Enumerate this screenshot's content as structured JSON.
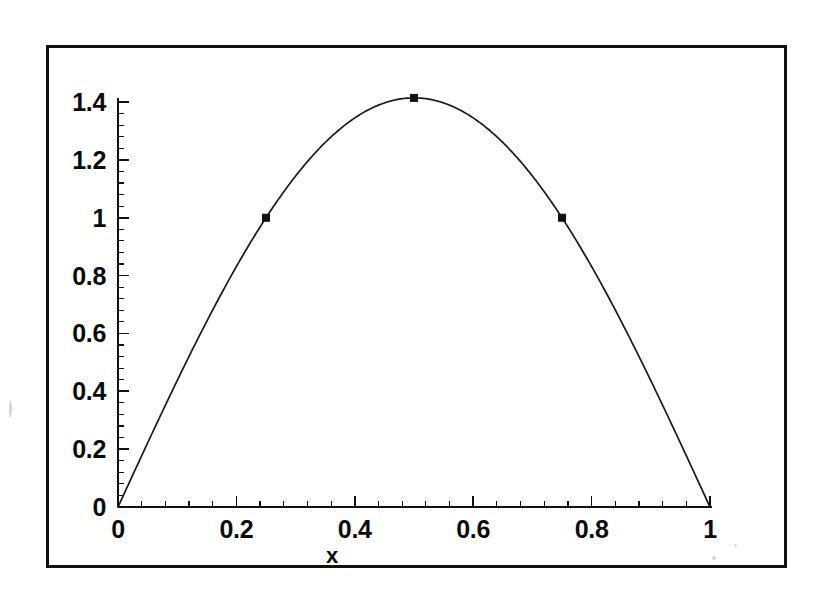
{
  "figure": {
    "background_color": "#ffffff",
    "frame_color": "#111111",
    "curve_color": "#1a1a1a",
    "marker_color": "#111111"
  },
  "chart_data": {
    "type": "line",
    "title": "",
    "subtitle": "",
    "xlabel": "x",
    "ylabel": "",
    "xlim": [
      0,
      1
    ],
    "ylim": [
      0,
      1.5
    ],
    "grid": false,
    "legend": null,
    "x_ticks": [
      "0",
      "0.2",
      "0.4",
      "0.6",
      "0.8",
      "1"
    ],
    "x_tick_values": [
      0,
      0.2,
      0.4,
      0.6,
      0.8,
      1
    ],
    "y_ticks": [
      "0",
      "0.2",
      "0.4",
      "0.6",
      "0.8",
      "1",
      "1.2",
      "1.4"
    ],
    "y_tick_values": [
      0,
      0.2,
      0.4,
      0.6,
      0.8,
      1,
      1.2,
      1.4
    ],
    "minor_ticks_per_major": 5,
    "series": [
      {
        "name": "curve",
        "style": "solid-line",
        "x": [
          0,
          0.02,
          0.04,
          0.06,
          0.08,
          0.1,
          0.12,
          0.14,
          0.16,
          0.18,
          0.2,
          0.22,
          0.24,
          0.26,
          0.28,
          0.3,
          0.32,
          0.34,
          0.36,
          0.38,
          0.4,
          0.42,
          0.44,
          0.46,
          0.48,
          0.5,
          0.52,
          0.54,
          0.56,
          0.58,
          0.6,
          0.62,
          0.64,
          0.66,
          0.68,
          0.7,
          0.72,
          0.74,
          0.76,
          0.78,
          0.8,
          0.82,
          0.84,
          0.86,
          0.88,
          0.9,
          0.92,
          0.94,
          0.96,
          0.98,
          1
        ],
        "y": [
          0,
          0.0888,
          0.1773,
          0.2652,
          0.3522,
          0.437,
          0.5218,
          0.604,
          0.6834,
          0.7597,
          0.8315,
          0.9004,
          0.9644,
          1.0235,
          1.0773,
          1.1259,
          1.1684,
          1.2053,
          1.2358,
          1.2603,
          1.2786,
          1.2908,
          1.2969,
          1.3019,
          1.3047,
          1.4142,
          1.3047,
          1.3019,
          1.2969,
          1.2908,
          1.2786,
          1.2603,
          1.2358,
          1.2053,
          1.1684,
          1.1259,
          1.0773,
          1.0235,
          0.9644,
          0.9004,
          0.8315,
          0.7597,
          0.6834,
          0.604,
          0.5218,
          0.437,
          0.3522,
          0.2652,
          0.1773,
          0.0888,
          0
        ]
      }
    ],
    "markers": [
      {
        "x": 0.25,
        "y": 1.0,
        "shape": "square"
      },
      {
        "x": 0.5,
        "y": 1.4142,
        "shape": "square"
      },
      {
        "x": 0.75,
        "y": 1.0,
        "shape": "square"
      }
    ],
    "function_expression": "sqrt(2)*sin(pi*x)",
    "peak_value": 1.4142,
    "peak_x": 0.5
  }
}
